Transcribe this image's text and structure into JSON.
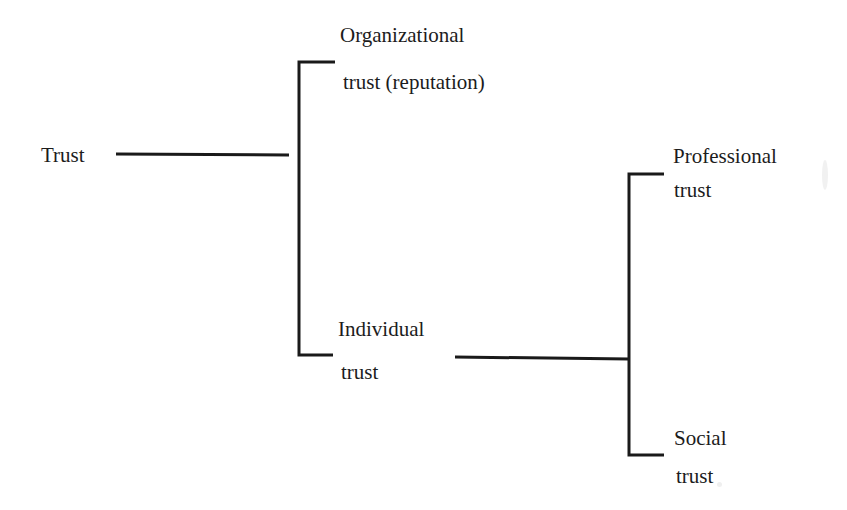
{
  "diagram": {
    "type": "tree",
    "orientation": "left-to-right",
    "nodes": {
      "root": {
        "label": "Trust"
      },
      "organizational": {
        "line1": "Organizational",
        "line2": "trust (reputation)"
      },
      "individual": {
        "line1": "Individual",
        "line2": "trust"
      },
      "professional": {
        "line1": "Professional",
        "line2": "trust"
      },
      "social": {
        "line1": "Social",
        "line2": "trust"
      }
    },
    "edges": [
      {
        "from": "Trust",
        "to": "Organizational trust (reputation)"
      },
      {
        "from": "Trust",
        "to": "Individual trust"
      },
      {
        "from": "Individual trust",
        "to": "Professional trust"
      },
      {
        "from": "Individual trust",
        "to": "Social trust"
      }
    ],
    "line_color": "#1a1a1a"
  }
}
